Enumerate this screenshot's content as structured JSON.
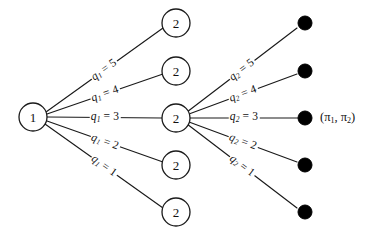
{
  "figure": {
    "background_color": "#ffffff",
    "line_color": "#1a1a1a",
    "terminal_color": "#000000"
  },
  "nodes": {
    "root": {
      "label": "1",
      "cx": 33,
      "cy": 117,
      "r": 14
    },
    "stage2": [
      {
        "label": "2",
        "cx": 176,
        "cy": 23,
        "r": 14
      },
      {
        "label": "2",
        "cx": 176,
        "cy": 71,
        "r": 14
      },
      {
        "label": "2",
        "cx": 176,
        "cy": 118,
        "r": 14
      },
      {
        "label": "2",
        "cx": 176,
        "cy": 165,
        "r": 14
      },
      {
        "label": "2",
        "cx": 176,
        "cy": 212,
        "r": 14
      }
    ]
  },
  "terminals": [
    {
      "cx": 305,
      "cy": 23,
      "r": 7
    },
    {
      "cx": 305,
      "cy": 71,
      "r": 7
    },
    {
      "cx": 305,
      "cy": 118,
      "r": 7
    },
    {
      "cx": 305,
      "cy": 165,
      "r": 7
    },
    {
      "cx": 305,
      "cy": 212,
      "r": 7
    }
  ],
  "stage1_edges": [
    {
      "id": "q1-5",
      "variable": "q",
      "subscript": "1",
      "value": "5",
      "text": "q1 = 5",
      "x1": 46,
      "y1": 112,
      "x2": 163,
      "y2": 28,
      "label_x": 104,
      "label_y": 70,
      "rotate": -35.7
    },
    {
      "id": "q1-4",
      "variable": "q",
      "subscript": "1",
      "value": "4",
      "text": "q1 = 4",
      "x1": 47,
      "y1": 114,
      "x2": 163,
      "y2": 74,
      "label_x": 105,
      "label_y": 94,
      "rotate": -19.0
    },
    {
      "id": "q1-3",
      "variable": "q",
      "subscript": "1",
      "value": "3",
      "text": "q1 = 3",
      "x1": 47,
      "y1": 117,
      "x2": 162,
      "y2": 118,
      "label_x": 105,
      "label_y": 117,
      "rotate": 0
    },
    {
      "id": "q1-2",
      "variable": "q",
      "subscript": "1",
      "value": "2",
      "text": "q1 = 2",
      "x1": 47,
      "y1": 121,
      "x2": 163,
      "y2": 162,
      "label_x": 105,
      "label_y": 142,
      "rotate": 19.5
    },
    {
      "id": "q1-1",
      "variable": "q",
      "subscript": "1",
      "value": "1",
      "text": "q1 = 1",
      "x1": 45,
      "y1": 124,
      "x2": 163,
      "y2": 208,
      "label_x": 104,
      "label_y": 166,
      "rotate": 35.5
    }
  ],
  "stage2_edges": [
    {
      "id": "q2-5",
      "variable": "q",
      "subscript": "2",
      "value": "5",
      "text": "q2 = 5",
      "x1": 187,
      "y1": 112,
      "x2": 297,
      "y2": 28,
      "label_x": 242,
      "label_y": 70,
      "rotate": -37.4
    },
    {
      "id": "q2-4",
      "variable": "q",
      "subscript": "2",
      "value": "4",
      "text": "q2 = 4",
      "x1": 189,
      "y1": 114,
      "x2": 297,
      "y2": 74,
      "label_x": 243,
      "label_y": 94,
      "rotate": -20.3
    },
    {
      "id": "q2-3",
      "variable": "q",
      "subscript": "2",
      "value": "3",
      "text": "q2 = 3",
      "x1": 190,
      "y1": 118,
      "x2": 298,
      "y2": 118,
      "label_x": 244,
      "label_y": 117,
      "rotate": 0
    },
    {
      "id": "q2-2",
      "variable": "q",
      "subscript": "2",
      "value": "2",
      "text": "q2 = 2",
      "x1": 189,
      "y1": 122,
      "x2": 297,
      "y2": 162,
      "label_x": 243,
      "label_y": 142,
      "rotate": 20.3
    },
    {
      "id": "q2-1",
      "variable": "q",
      "subscript": "2",
      "value": "1",
      "text": "q2 = 1",
      "x1": 187,
      "y1": 124,
      "x2": 297,
      "y2": 208,
      "label_x": 242,
      "label_y": 166,
      "rotate": 37.4
    }
  ],
  "payoff": {
    "text": "(π1, π2)",
    "open_paren": "(",
    "pi1_symbol": "π",
    "pi1_sub": "1",
    "separator": ", ",
    "pi2_symbol": "π",
    "pi2_sub": "2",
    "close_paren": ")",
    "x": 320,
    "y": 111
  }
}
